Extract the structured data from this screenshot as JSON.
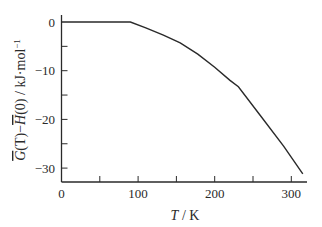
{
  "chart_data": {
    "type": "line",
    "title": "",
    "xlabel": "T / K",
    "xlabel_parts": {
      "var": "T",
      "unit": " / K"
    },
    "ylabel": "Ḡ(T) − H̄(0) / kJ·mol⁻¹",
    "ylabel_parts": {
      "g": "G",
      "t1": "(T)",
      "minus": "−",
      "h": "H",
      "t2": "(0) / kJ·mol",
      "sup": "−1"
    },
    "xlim": [
      0,
      320
    ],
    "ylim": [
      -32,
      0
    ],
    "x_ticks": [
      0,
      50,
      100,
      150,
      200,
      250,
      300
    ],
    "x_tick_labels": [
      "0",
      "",
      "100",
      "",
      "200",
      "",
      "300"
    ],
    "y_ticks": [
      0,
      -5,
      -10,
      -15,
      -20,
      -25,
      -30
    ],
    "y_tick_labels": [
      "0",
      "",
      "−10",
      "",
      "−20",
      "",
      "−30"
    ],
    "grid": false,
    "legend": null,
    "series": [
      {
        "name": "G(T) - H(0)",
        "x": [
          0,
          90,
          110,
          133,
          155,
          178,
          200,
          220,
          231,
          260,
          290,
          315
        ],
        "y": [
          0,
          0,
          -1.2,
          -2.7,
          -4.3,
          -6.6,
          -9.3,
          -12.0,
          -13.3,
          -19.3,
          -25.5,
          -31.2
        ]
      }
    ]
  }
}
